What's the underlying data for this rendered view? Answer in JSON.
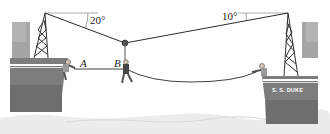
{
  "figure": {
    "type": "statics-diagram",
    "angles": {
      "left": "20°",
      "right": "10°"
    },
    "points": {
      "a": "A",
      "b": "B"
    },
    "ship_name": "S. S. DUKE"
  },
  "colors": {
    "hull": "#7d7d7d",
    "hull_dark": "#6a6a6a",
    "cabin": "#a5a5a5",
    "stripe": "#ffffff",
    "cable": "#2a2a2a",
    "water": "#ececec",
    "background": "#ffffff"
  }
}
